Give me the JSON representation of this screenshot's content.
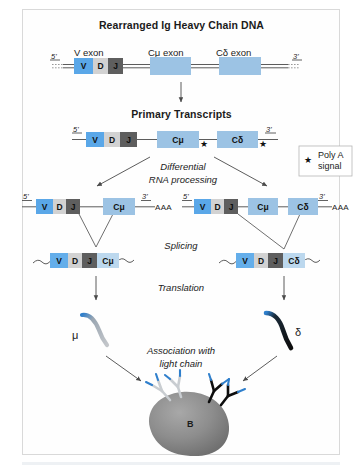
{
  "figure": {
    "title_dna": "Rearranged Ig Heavy Chain DNA",
    "title_transcripts": "Primary Transcripts"
  },
  "dna": {
    "five_prime": "5'",
    "three_prime": "3'",
    "exon_labels": {
      "v": "V exon",
      "cmu": "Cμ exon",
      "cdelta": "Cδ exon"
    },
    "segments": [
      {
        "label": "V",
        "kind": "v-box"
      },
      {
        "label": "D",
        "kind": "d-box"
      },
      {
        "label": "J",
        "kind": "j-box"
      },
      {
        "label": "",
        "kind": "cmu-box"
      },
      {
        "label": "",
        "kind": "cdelta-box"
      }
    ]
  },
  "primary_transcript": {
    "five_prime": "5'",
    "three_prime": "3'",
    "segments": [
      {
        "label": "V"
      },
      {
        "label": "D"
      },
      {
        "label": "J"
      },
      {
        "label": "Cμ"
      },
      {
        "label": "Cδ"
      }
    ],
    "star_glyph": "★"
  },
  "legend": {
    "star_glyph": "★",
    "line1": "Poly A",
    "line2": "signal"
  },
  "steps": {
    "differential_line1": "Differential",
    "differential_line2": "RNA processing",
    "splicing": "Splicing",
    "translation": "Translation",
    "association_line1": "Association with",
    "association_line2": "light chain"
  },
  "processed_left": {
    "five_prime": "5'",
    "three_prime": "3'",
    "poly_a": "AAA",
    "segments": [
      {
        "label": "V"
      },
      {
        "label": "D"
      },
      {
        "label": "J"
      },
      {
        "label": "Cμ"
      }
    ]
  },
  "processed_right": {
    "five_prime": "5'",
    "three_prime": "3'",
    "poly_a": "AAA",
    "segments": [
      {
        "label": "V"
      },
      {
        "label": "D"
      },
      {
        "label": "J"
      },
      {
        "label": "Cμ"
      },
      {
        "label": "Cδ"
      }
    ]
  },
  "spliced_left": {
    "segments": [
      {
        "label": "V"
      },
      {
        "label": "D"
      },
      {
        "label": "J"
      },
      {
        "label": "Cμ"
      }
    ]
  },
  "spliced_right": {
    "segments": [
      {
        "label": "V"
      },
      {
        "label": "D"
      },
      {
        "label": "J"
      },
      {
        "label": "Cδ"
      }
    ]
  },
  "proteins": {
    "mu_label": "μ",
    "delta_label": "δ"
  },
  "bcell": {
    "label": "B"
  },
  "colors": {
    "v_blue": "#5aa7e8",
    "d_gray": "#d2d2d2",
    "j_dark": "#5e5e5e",
    "c_blue": "#9cc3e4",
    "spliced_blue": "#bcd8ee",
    "line": "#4a4a4a",
    "frame": "#d9d9d9",
    "cell_gray": "#8a8a8a",
    "mu_chain": "#b9bcc0",
    "delta_chain": "#111111",
    "chain_tip_blue": "#1f6fc4"
  }
}
